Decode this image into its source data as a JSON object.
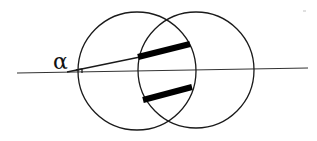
{
  "diagram": {
    "labels": {
      "angle": "α"
    },
    "elements": [
      "left-circle",
      "right-circle",
      "horizontal-axis",
      "inclined-ray",
      "upper-band",
      "lower-band",
      "angle-marker"
    ],
    "colors": {
      "stroke": "#1a1a1a",
      "band": "#000000",
      "background": "#ffffff"
    }
  }
}
